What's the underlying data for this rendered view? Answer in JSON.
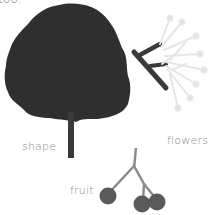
{
  "top_text": "too.",
  "labels": {
    "shape": "shape",
    "flowers": "flowers",
    "fruit": "fruit"
  },
  "colors": {
    "tree": "#2f2f2f",
    "twig": "#3a3a3a",
    "fruit": "#5a5a5a",
    "stem": "#8a8a8a",
    "flower": "#e6e6e6",
    "label": "#8a8a8a"
  }
}
